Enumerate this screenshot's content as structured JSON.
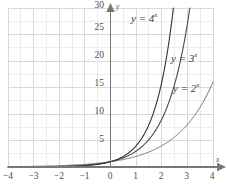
{
  "chart_data": {
    "type": "line",
    "title": "",
    "subtitle": "",
    "xlabel": "x",
    "ylabel": "y",
    "xlim": [
      -4,
      4
    ],
    "ylim": [
      0,
      30
    ],
    "grid": true,
    "major_grid_x_step": 1,
    "major_grid_y_step": 5,
    "minor_grid_x_step": 0.5,
    "minor_grid_y_step": 2.5,
    "legend_position": "inline-curve-labels",
    "xticks": [
      -4,
      -3,
      -2,
      -1,
      0,
      1,
      2,
      3,
      4
    ],
    "xtick_labels": [
      "−4",
      "−3",
      "−2",
      "−1",
      "0",
      "1",
      "2",
      "3",
      "4"
    ],
    "yticks": [
      5,
      10,
      15,
      20,
      25,
      30
    ],
    "ytick_labels": [
      "5",
      "10",
      "15",
      "20",
      "25",
      "30"
    ],
    "series": [
      {
        "name": "y = 2^x",
        "base": 2,
        "label_text": "y = 2",
        "label_exponent": "x",
        "color": "#6e6e6e",
        "x": [
          -4,
          -3.5,
          -3,
          -2.5,
          -2,
          -1.5,
          -1,
          -0.5,
          0,
          0.5,
          1,
          1.5,
          2,
          2.5,
          3,
          3.5,
          4
        ],
        "values": [
          0.0625,
          0.088,
          0.125,
          0.177,
          0.25,
          0.354,
          0.5,
          0.707,
          1,
          1.414,
          2,
          2.828,
          4,
          5.657,
          8,
          11.314,
          16
        ]
      },
      {
        "name": "y = 3^x",
        "base": 3,
        "label_text": "y = 3",
        "label_exponent": "x",
        "color": "#4a4a4a",
        "x": [
          -4,
          -3.5,
          -3,
          -2.5,
          -2,
          -1.5,
          -1,
          -0.5,
          0,
          0.5,
          1,
          1.5,
          2,
          2.5,
          3,
          3.096
        ],
        "values": [
          0.0123,
          0.0214,
          0.037,
          0.0641,
          0.111,
          0.192,
          0.333,
          0.577,
          1,
          1.732,
          3,
          5.196,
          9,
          15.588,
          27,
          30
        ]
      },
      {
        "name": "y = 4^x",
        "base": 4,
        "label_text": "y = 4",
        "label_exponent": "x",
        "color": "#333333",
        "x": [
          -4,
          -3.5,
          -3,
          -2.5,
          -2,
          -1.5,
          -1,
          -0.5,
          0,
          0.5,
          1,
          1.5,
          2,
          2.453
        ],
        "values": [
          0.0039,
          0.0078,
          0.0156,
          0.0313,
          0.0625,
          0.125,
          0.25,
          0.5,
          1,
          2,
          4,
          8,
          16,
          30
        ]
      }
    ],
    "annotations": [
      {
        "text": "y = 4",
        "exponent": "x",
        "x_px": 131,
        "y_px": 13
      },
      {
        "text": "y = 3",
        "exponent": "x",
        "x_px": 171,
        "y_px": 53
      },
      {
        "text": "y = 2",
        "exponent": "x",
        "x_px": 173,
        "y_px": 83
      }
    ],
    "colors": {
      "major_grid": "#d8d8e2",
      "minor_grid": "#ececf2",
      "axis": "#787878",
      "tick_text": "#4d4d4d",
      "background": "#ffffff"
    }
  },
  "axis_labels": {
    "x_name": "x",
    "y_name": "y"
  }
}
